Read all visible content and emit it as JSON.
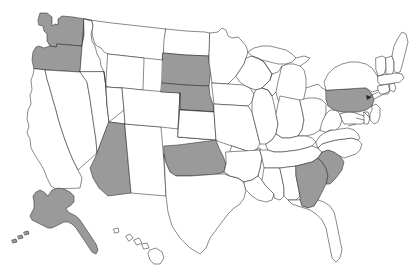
{
  "figure": {
    "kind": "choropleth-map",
    "region": "United States",
    "background_color": "#ffffff",
    "highlight_color": "#9a9a9a",
    "plain_color": "#ffffff",
    "outline_color": "#2b2b2b",
    "highlighted_count": 10,
    "highlighted_states": [
      "Washington",
      "Oregon",
      "Arizona",
      "South Dakota",
      "Nebraska",
      "Oklahoma",
      "Pennsylvania",
      "South Carolina",
      "Georgia",
      "Alaska"
    ]
  },
  "states": [
    {
      "code": "WA",
      "name": "Washington",
      "highlighted": true
    },
    {
      "code": "OR",
      "name": "Oregon",
      "highlighted": true
    },
    {
      "code": "CA",
      "name": "California",
      "highlighted": false
    },
    {
      "code": "NV",
      "name": "Nevada",
      "highlighted": false
    },
    {
      "code": "ID",
      "name": "Idaho",
      "highlighted": false
    },
    {
      "code": "MT",
      "name": "Montana",
      "highlighted": false
    },
    {
      "code": "WY",
      "name": "Wyoming",
      "highlighted": false
    },
    {
      "code": "UT",
      "name": "Utah",
      "highlighted": false
    },
    {
      "code": "AZ",
      "name": "Arizona",
      "highlighted": true
    },
    {
      "code": "NM",
      "name": "New Mexico",
      "highlighted": false
    },
    {
      "code": "CO",
      "name": "Colorado",
      "highlighted": false
    },
    {
      "code": "ND",
      "name": "North Dakota",
      "highlighted": false
    },
    {
      "code": "SD",
      "name": "South Dakota",
      "highlighted": true
    },
    {
      "code": "NE",
      "name": "Nebraska",
      "highlighted": true
    },
    {
      "code": "KS",
      "name": "Kansas",
      "highlighted": false
    },
    {
      "code": "OK",
      "name": "Oklahoma",
      "highlighted": true
    },
    {
      "code": "TX",
      "name": "Texas",
      "highlighted": false
    },
    {
      "code": "MN",
      "name": "Minnesota",
      "highlighted": false
    },
    {
      "code": "IA",
      "name": "Iowa",
      "highlighted": false
    },
    {
      "code": "MO",
      "name": "Missouri",
      "highlighted": false
    },
    {
      "code": "AR",
      "name": "Arkansas",
      "highlighted": false
    },
    {
      "code": "LA",
      "name": "Louisiana",
      "highlighted": false
    },
    {
      "code": "WI",
      "name": "Wisconsin",
      "highlighted": false
    },
    {
      "code": "IL",
      "name": "Illinois",
      "highlighted": false
    },
    {
      "code": "MI",
      "name": "Michigan",
      "highlighted": false
    },
    {
      "code": "IN",
      "name": "Indiana",
      "highlighted": false
    },
    {
      "code": "OH",
      "name": "Ohio",
      "highlighted": false
    },
    {
      "code": "KY",
      "name": "Kentucky",
      "highlighted": false
    },
    {
      "code": "TN",
      "name": "Tennessee",
      "highlighted": false
    },
    {
      "code": "MS",
      "name": "Mississippi",
      "highlighted": false
    },
    {
      "code": "AL",
      "name": "Alabama",
      "highlighted": false
    },
    {
      "code": "GA",
      "name": "Georgia",
      "highlighted": true
    },
    {
      "code": "FL",
      "name": "Florida",
      "highlighted": false
    },
    {
      "code": "SC",
      "name": "South Carolina",
      "highlighted": true
    },
    {
      "code": "NC",
      "name": "North Carolina",
      "highlighted": false
    },
    {
      "code": "VA",
      "name": "Virginia",
      "highlighted": false
    },
    {
      "code": "WV",
      "name": "West Virginia",
      "highlighted": false
    },
    {
      "code": "MD",
      "name": "Maryland",
      "highlighted": false
    },
    {
      "code": "DE",
      "name": "Delaware",
      "highlighted": false
    },
    {
      "code": "PA",
      "name": "Pennsylvania",
      "highlighted": true
    },
    {
      "code": "NJ",
      "name": "New Jersey",
      "highlighted": false
    },
    {
      "code": "NY",
      "name": "New York",
      "highlighted": false
    },
    {
      "code": "CT",
      "name": "Connecticut",
      "highlighted": false
    },
    {
      "code": "RI",
      "name": "Rhode Island",
      "highlighted": false
    },
    {
      "code": "MA",
      "name": "Massachusetts",
      "highlighted": false
    },
    {
      "code": "VT",
      "name": "Vermont",
      "highlighted": false
    },
    {
      "code": "NH",
      "name": "New Hampshire",
      "highlighted": false
    },
    {
      "code": "ME",
      "name": "Maine",
      "highlighted": false
    },
    {
      "code": "AK",
      "name": "Alaska",
      "highlighted": true
    },
    {
      "code": "HI",
      "name": "Hawaii",
      "highlighted": false
    }
  ]
}
